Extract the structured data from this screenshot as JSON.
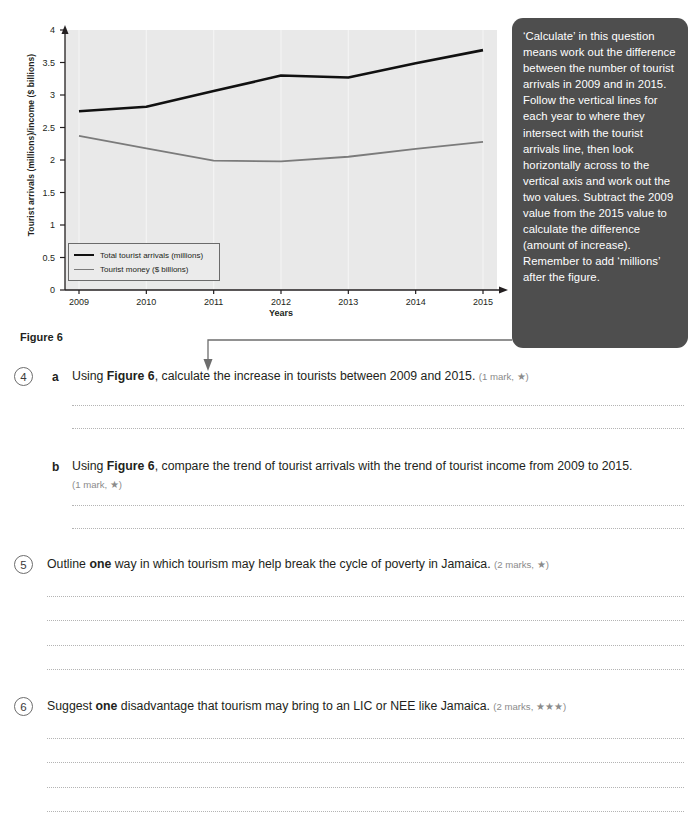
{
  "figure": {
    "caption": "Figure 6",
    "x_axis_title": "Years",
    "y_axis_title": "Tourist arrivals (millions)/income ($ billions)"
  },
  "chart_data": {
    "type": "line",
    "title": "",
    "xlabel": "Years",
    "ylabel": "Tourist arrivals (millions)/income ($ billions)",
    "categories": [
      "2009",
      "2010",
      "2011",
      "2012",
      "2013",
      "2014",
      "2015"
    ],
    "x": [
      2009,
      2010,
      2011,
      2012,
      2013,
      2014,
      2015
    ],
    "ylim": [
      0,
      4
    ],
    "yticks": [
      "0",
      "0.5",
      "1",
      "1.5",
      "2",
      "2.5",
      "3",
      "3.5",
      "4"
    ],
    "ytick_values": [
      0,
      0.5,
      1,
      1.5,
      2,
      2.5,
      3,
      3.5,
      4
    ],
    "grid": true,
    "legend_position": "lower-left",
    "series": [
      {
        "name": "Total tourist arrivals (millions)",
        "color": "#111111",
        "width": 2.6,
        "values": [
          2.75,
          2.82,
          3.06,
          3.3,
          3.27,
          3.49,
          3.69
        ]
      },
      {
        "name": "Tourist money ($ billions)",
        "color": "#7b7b7b",
        "width": 1.8,
        "values": [
          2.37,
          2.18,
          1.99,
          1.98,
          2.05,
          2.17,
          2.28
        ]
      }
    ]
  },
  "callout": {
    "text": "‘Calculate’ in this question means work out the difference between the number of tourist arrivals in 2009 and in 2015. Follow the vertical lines for each year to where they intersect with the tourist arrivals line, then look horizontally across to the vertical axis and work out the two values. Subtract the 2009 value from the 2015 value to calculate the difference (amount of increase). Remember to add ‘millions’ after the figure."
  },
  "questions": [
    {
      "number": "4",
      "letter": "a",
      "text_before_bold": "Using ",
      "bold": "Figure 6",
      "text_after_bold": ", calculate the increase in tourists between 2009 and 2015.",
      "marks": "(1 mark, ★)",
      "answer_lines": 2
    },
    {
      "number": "",
      "letter": "b",
      "text_before_bold": "Using ",
      "bold": "Figure 6",
      "text_after_bold": ", compare the trend of tourist arrivals with the trend of tourist income from 2009 to 2015.",
      "marks": "(1 mark, ★)",
      "answer_lines": 2
    },
    {
      "number": "5",
      "letter": "",
      "text_before_bold": "Outline ",
      "bold": "one",
      "text_after_bold": " way in which tourism may help break the cycle of poverty in Jamaica.",
      "marks": "(2 marks, ★)",
      "answer_lines": 4
    },
    {
      "number": "6",
      "letter": "",
      "text_before_bold": "Suggest ",
      "bold": "one",
      "text_after_bold": " disadvantage that tourism may bring to an LIC or NEE like Jamaica.",
      "marks": "(2 marks, ★★★)",
      "answer_lines": 4
    }
  ],
  "colors": {
    "plot_background": "#e9e9e9",
    "callout_background": "#4e4e4e",
    "series_primary": "#111111",
    "series_secondary": "#7b7b7b",
    "answer_line": "#b4b4b4"
  }
}
